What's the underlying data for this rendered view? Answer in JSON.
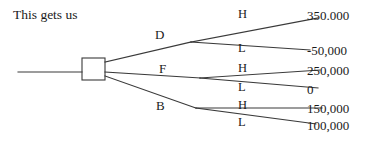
{
  "caption": "This gets us",
  "diagram": {
    "root_node": "decision-square",
    "decision_branches": [
      {
        "id": "D",
        "label": "D"
      },
      {
        "id": "F",
        "label": "F"
      },
      {
        "id": "B",
        "label": "B"
      }
    ],
    "outcome_labels": {
      "high": "H",
      "low": "L"
    },
    "outcomes": [
      {
        "branch": "D",
        "state": "H",
        "payoff": "350.000"
      },
      {
        "branch": "D",
        "state": "L",
        "payoff": "-50,000"
      },
      {
        "branch": "F",
        "state": "H",
        "payoff": "250,000"
      },
      {
        "branch": "F",
        "state": "L",
        "payoff": "0"
      },
      {
        "branch": "B",
        "state": "H",
        "payoff": "150,000"
      },
      {
        "branch": "B",
        "state": "L",
        "payoff": "100,000"
      }
    ]
  },
  "colors": {
    "background": "#ffffff",
    "ink": "#1a1a1a",
    "line": "#3a3a3a"
  }
}
